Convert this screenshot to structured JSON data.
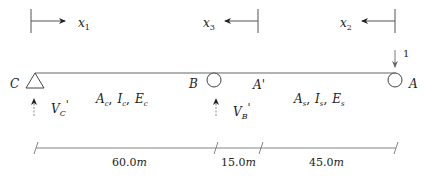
{
  "diagram": {
    "type": "continuous beam with influence-line unit load",
    "nodes": [
      {
        "id": "C",
        "label": "C",
        "support": "pin"
      },
      {
        "id": "B",
        "label": "B",
        "support": "roller"
      },
      {
        "id": "A_prime",
        "label": "A'",
        "support": "none"
      },
      {
        "id": "A",
        "label": "A",
        "support": "roller"
      }
    ],
    "coordinate_axes": [
      {
        "label": "x",
        "subscript": "1",
        "direction": "right"
      },
      {
        "label": "x",
        "subscript": "3",
        "direction": "left"
      },
      {
        "label": "x",
        "subscript": "2",
        "direction": "left"
      }
    ],
    "unit_load": {
      "value": "1",
      "direction": "down"
    },
    "reactions": [
      {
        "label": "V",
        "subscript": "C",
        "prime": "'"
      },
      {
        "label": "V",
        "subscript": "B",
        "prime": "'"
      }
    ],
    "segments": [
      {
        "props": [
          {
            "s": "A",
            "sub": "c"
          },
          {
            "s": "I",
            "sub": "c"
          },
          {
            "s": "E",
            "sub": "c"
          }
        ]
      },
      {
        "props": [
          {
            "s": "A",
            "sub": "s"
          },
          {
            "s": "I",
            "sub": "s"
          },
          {
            "s": "E",
            "sub": "s"
          }
        ]
      }
    ],
    "dimensions": [
      {
        "value": 60.0,
        "text": "60.0m"
      },
      {
        "value": 15.0,
        "text": "15.0m"
      },
      {
        "value": 45.0,
        "text": "45.0m"
      }
    ],
    "separator": ","
  }
}
